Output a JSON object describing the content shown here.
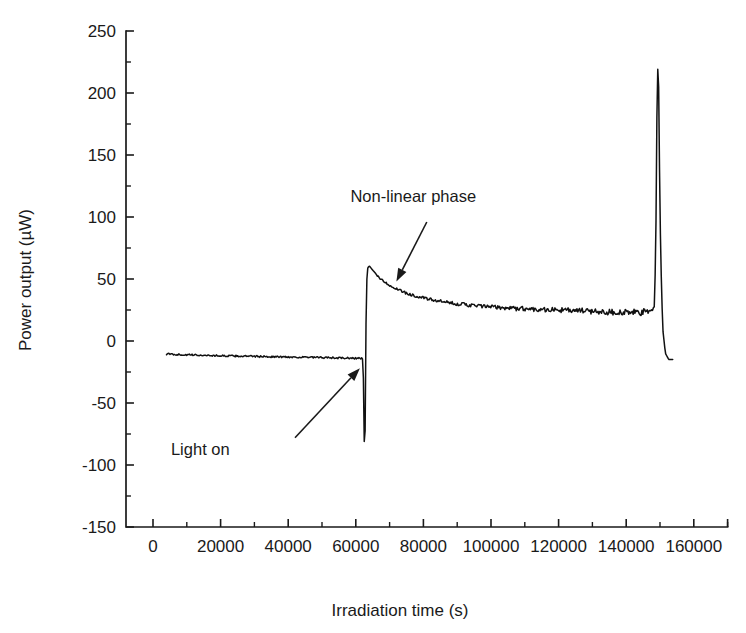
{
  "chart_data": {
    "type": "line",
    "title": "",
    "xlabel": "Irradiation time (s)",
    "ylabel": "Power output (µW)",
    "xlim": [
      -8000,
      170000
    ],
    "ylim": [
      -150,
      250
    ],
    "xticks": [
      0,
      20000,
      40000,
      60000,
      80000,
      100000,
      120000,
      140000,
      160000
    ],
    "xtick_labels": [
      "0",
      "20000",
      "40000",
      "60000",
      "80000",
      "100000",
      "120000",
      "140000",
      "160000"
    ],
    "yticks": [
      -150,
      -100,
      -50,
      0,
      50,
      100,
      150,
      200,
      250
    ],
    "ytick_labels": [
      "-150",
      "-100",
      "-50",
      "0",
      "50",
      "100",
      "150",
      "200",
      "250"
    ],
    "x_minor_tick_interval": 10000,
    "y_minor_tick_interval": 25,
    "grid": false,
    "legend": false,
    "axis_style": "left-and-bottom-spines-only",
    "line_color": "#111111",
    "series": [
      {
        "name": "Power output",
        "x": [
          4000,
          8000,
          12000,
          16000,
          20000,
          24000,
          28000,
          32000,
          36000,
          40000,
          44000,
          48000,
          52000,
          56000,
          60000,
          62000,
          62400,
          62600,
          62800,
          63000,
          63200,
          63400,
          63600,
          64000,
          64600,
          65200,
          66000,
          67000,
          68000,
          70000,
          72000,
          75000,
          78000,
          82000,
          86000,
          90000,
          95000,
          100000,
          105000,
          110000,
          115000,
          120000,
          125000,
          130000,
          135000,
          140000,
          144000,
          147000,
          148400,
          148800,
          149000,
          149200,
          149400,
          149600,
          149800,
          150200,
          150800,
          151600,
          152600,
          154000
        ],
        "y": [
          -10.5,
          -11.0,
          -11.3,
          -11.6,
          -11.9,
          -12.1,
          -12.3,
          -12.5,
          -12.7,
          -12.9,
          -13.1,
          -13.3,
          -13.5,
          -13.7,
          -13.9,
          -14.0,
          -40,
          -122,
          -60,
          10,
          45,
          57,
          59.5,
          60.5,
          58.5,
          56.5,
          54,
          51,
          48.5,
          45,
          42,
          38.5,
          36,
          33.5,
          31.5,
          30,
          28.5,
          27.5,
          26.5,
          26,
          25.5,
          25,
          24.5,
          24,
          23.5,
          23,
          23,
          23.5,
          28,
          90,
          160,
          210,
          223,
          205,
          150,
          70,
          10,
          -10,
          -15,
          -15
        ]
      }
    ],
    "annotations": [
      {
        "id": "light-on",
        "text": "Light on",
        "text_x": 14000,
        "text_y": -92,
        "arrow_from_x": 42000,
        "arrow_from_y": -78,
        "arrow_to_x": 61200,
        "arrow_to_y": -22
      },
      {
        "id": "non-linear-phase",
        "text": "Non-linear phase",
        "text_x": 77000,
        "text_y": 112,
        "arrow_from_x": 81000,
        "arrow_from_y": 96,
        "arrow_to_x": 72000,
        "arrow_to_y": 48
      }
    ]
  }
}
